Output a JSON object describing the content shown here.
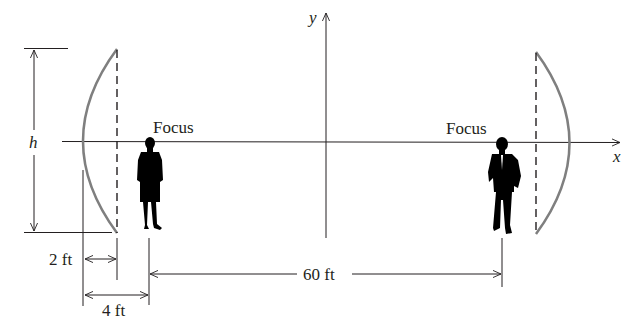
{
  "diagram": {
    "type": "parabolic reflectors (whispering gallery)",
    "colors": {
      "background": "#ffffff",
      "ink": "#231f20",
      "reflector": "#7f7f7f",
      "silhouette": "#000000"
    },
    "axes": {
      "x_label": "x",
      "y_label": "y"
    },
    "labels": {
      "height": "h",
      "focus_left": "Focus",
      "focus_right": "Focus",
      "depth": "2 ft",
      "focal_length": "4 ft",
      "separation": "60 ft"
    },
    "figures": {
      "left": "woman-silhouette",
      "right": "man-silhouette"
    }
  }
}
